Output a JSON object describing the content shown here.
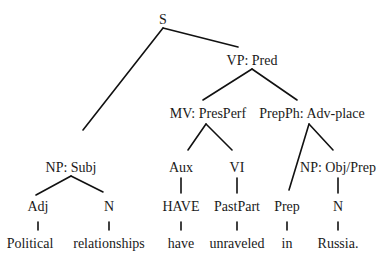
{
  "diagram": {
    "type": "syntax-tree",
    "nodes": {
      "S": {
        "label": "S",
        "x": 163,
        "y": 24
      },
      "VP": {
        "label": "VP: Pred",
        "x": 252,
        "y": 65
      },
      "MV": {
        "label": "MV: PresPerf",
        "x": 208,
        "y": 118
      },
      "PrepPh": {
        "label": "PrepPh: Adv-place",
        "x": 312,
        "y": 118
      },
      "NPSubj": {
        "label": "NP: Subj",
        "x": 71,
        "y": 172
      },
      "Aux": {
        "label": "Aux",
        "x": 181,
        "y": 172
      },
      "VI": {
        "label": "VI",
        "x": 237,
        "y": 172
      },
      "NPObj": {
        "label": "NP: Obj/Prep",
        "x": 338,
        "y": 172
      },
      "Adj": {
        "label": "Adj",
        "x": 38,
        "y": 211
      },
      "N1": {
        "label": "N",
        "x": 109,
        "y": 211
      },
      "HAVE": {
        "label": "HAVE",
        "x": 181,
        "y": 211
      },
      "PastPart": {
        "label": "PastPart",
        "x": 237,
        "y": 211
      },
      "Prep": {
        "label": "Prep",
        "x": 287,
        "y": 211
      },
      "N2": {
        "label": "N",
        "x": 338,
        "y": 211
      },
      "w1": {
        "label": "Political",
        "x": 30,
        "y": 248
      },
      "w2": {
        "label": "relationships",
        "x": 109,
        "y": 248
      },
      "w3": {
        "label": "have",
        "x": 181,
        "y": 248
      },
      "w4": {
        "label": "unraveled",
        "x": 237,
        "y": 248
      },
      "w5": {
        "label": "in",
        "x": 287,
        "y": 248
      },
      "w6": {
        "label": "Russia.",
        "x": 338,
        "y": 248
      }
    },
    "edges": [
      {
        "from": "S",
        "to": "VP",
        "x1": 163,
        "y1": 28,
        "x2": 238,
        "y2": 47
      },
      {
        "from": "S",
        "to": "NPSubj",
        "x1": 163,
        "y1": 28,
        "x2": 83,
        "y2": 130
      },
      {
        "from": "VP",
        "to": "MV",
        "x1": 252,
        "y1": 69,
        "x2": 203,
        "y2": 100
      },
      {
        "from": "VP",
        "to": "PrepPh",
        "x1": 252,
        "y1": 69,
        "x2": 297,
        "y2": 100
      },
      {
        "from": "NPSubj",
        "to": "Adj",
        "x1": 71,
        "y1": 176,
        "x2": 36,
        "y2": 195
      },
      {
        "from": "NPSubj",
        "to": "N1",
        "x1": 71,
        "y1": 176,
        "x2": 103,
        "y2": 192
      },
      {
        "from": "MV",
        "to": "Aux",
        "x1": 206,
        "y1": 124,
        "x2": 188,
        "y2": 150
      },
      {
        "from": "MV",
        "to": "VI",
        "x1": 206,
        "y1": 124,
        "x2": 232,
        "y2": 150
      },
      {
        "from": "VI",
        "to": "PastPart",
        "x1": 237,
        "y1": 178,
        "x2": 237,
        "y2": 193
      },
      {
        "from": "Aux",
        "to": "HAVE",
        "x1": 181,
        "y1": 178,
        "x2": 181,
        "y2": 193
      },
      {
        "from": "PrepPh",
        "to": "Prep",
        "x1": 309,
        "y1": 124,
        "x2": 289,
        "y2": 190
      },
      {
        "from": "PrepPh",
        "to": "NPObj",
        "x1": 309,
        "y1": 124,
        "x2": 333,
        "y2": 150
      },
      {
        "from": "NPObj",
        "to": "N2",
        "x1": 338,
        "y1": 178,
        "x2": 338,
        "y2": 193
      },
      {
        "from": "Adj",
        "to": "w1",
        "x1": 38,
        "y1": 222,
        "x2": 38,
        "y2": 230
      },
      {
        "from": "N1",
        "to": "w2",
        "x1": 109,
        "y1": 222,
        "x2": 109,
        "y2": 230
      },
      {
        "from": "HAVE",
        "to": "w3",
        "x1": 181,
        "y1": 222,
        "x2": 181,
        "y2": 230
      },
      {
        "from": "PastPart",
        "to": "w4",
        "x1": 237,
        "y1": 222,
        "x2": 237,
        "y2": 230
      },
      {
        "from": "Prep",
        "to": "w5",
        "x1": 287,
        "y1": 222,
        "x2": 287,
        "y2": 230
      },
      {
        "from": "N2",
        "to": "w6",
        "x1": 338,
        "y1": 222,
        "x2": 338,
        "y2": 230
      }
    ]
  }
}
